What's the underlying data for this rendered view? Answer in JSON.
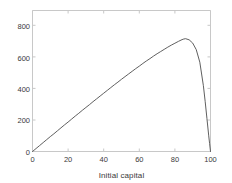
{
  "chart_data": {
    "type": "line",
    "title": "",
    "xlabel": "Initial capital",
    "ylabel": "Expected duration",
    "xlim": [
      0,
      100
    ],
    "ylim": [
      0,
      900
    ],
    "xticks": [
      0,
      20,
      40,
      60,
      80,
      100
    ],
    "yticks": [
      0,
      200,
      400,
      600,
      800
    ],
    "grid": false,
    "legend": null,
    "line_color": "#4d4d4d",
    "axis_color": "#c8c8c8",
    "text_color": "#3a3a3a",
    "background": "#ffffff",
    "series": [
      {
        "name": "Expected duration",
        "x": [
          0,
          2,
          4,
          6,
          8,
          10,
          12,
          14,
          16,
          18,
          20,
          22,
          24,
          26,
          28,
          30,
          32,
          34,
          36,
          38,
          40,
          42,
          44,
          46,
          48,
          50,
          52,
          54,
          56,
          58,
          60,
          62,
          64,
          66,
          68,
          70,
          72,
          74,
          76,
          78,
          80,
          82,
          84,
          85,
          86,
          88,
          90,
          92,
          94,
          96,
          97,
          98,
          99,
          99.5,
          100
        ],
        "values": [
          0,
          19,
          38,
          57,
          76,
          95,
          113,
          132,
          151,
          170,
          188,
          207,
          226,
          244,
          263,
          281,
          299,
          318,
          336,
          354,
          372,
          390,
          408,
          426,
          443,
          461,
          478,
          495,
          512,
          529,
          545,
          562,
          578,
          593,
          609,
          624,
          638,
          652,
          666,
          679,
          691,
          703,
          714,
          718,
          720,
          713,
          692,
          650,
          570,
          420,
          320,
          210,
          100,
          50,
          0
        ]
      }
    ],
    "peak": {
      "x": 85,
      "y": 800
    }
  }
}
